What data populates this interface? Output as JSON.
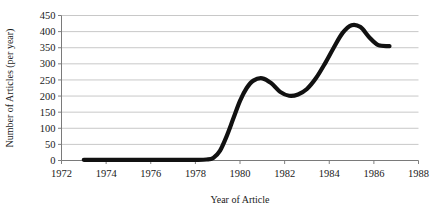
{
  "chart_data": {
    "type": "line",
    "title": "",
    "xlabel": "Year of Article",
    "ylabel": "Number of Articles (per year)",
    "xlim": [
      1972,
      1988
    ],
    "ylim": [
      0,
      450
    ],
    "xticks": [
      1972,
      1974,
      1976,
      1978,
      1980,
      1982,
      1984,
      1986,
      1988
    ],
    "xtick_labels": [
      "1972",
      "1974",
      "1976",
      "1978",
      "1980",
      "1982",
      "1984",
      "1986",
      "1988"
    ],
    "yticks": [
      0,
      50,
      100,
      150,
      200,
      250,
      300,
      350,
      400,
      450
    ],
    "ytick_labels": [
      "0",
      "50",
      "100",
      "150",
      "200",
      "250",
      "300",
      "350",
      "400",
      "450"
    ],
    "grid": "horizontal",
    "legend": "none",
    "line_color": "#111111",
    "grid_color": "#c8c8c8",
    "axis_color": "#808080",
    "series": [
      {
        "name": "Number of Articles",
        "x": [
          1973.0,
          1974.0,
          1975.0,
          1976.0,
          1977.0,
          1978.0,
          1978.5,
          1978.8,
          1979.1,
          1979.4,
          1979.7,
          1980.0,
          1980.3,
          1980.6,
          1981.0,
          1981.4,
          1981.8,
          1982.2,
          1982.6,
          1983.0,
          1983.4,
          1983.8,
          1984.2,
          1984.6,
          1985.0,
          1985.4,
          1985.8,
          1986.2,
          1986.7
        ],
        "y": [
          2,
          2,
          2,
          2,
          2,
          2,
          3,
          8,
          30,
          75,
          130,
          185,
          225,
          248,
          255,
          240,
          213,
          201,
          205,
          222,
          255,
          300,
          350,
          396,
          420,
          414,
          382,
          358,
          355
        ]
      }
    ]
  },
  "axes": {
    "y_axis_title": "Number of Articles (per year)",
    "x_axis_title": "Year of Article"
  }
}
